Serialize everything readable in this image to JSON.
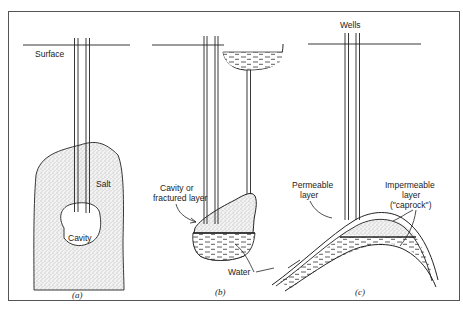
{
  "figure": {
    "panels": [
      {
        "id": "a",
        "caption": "(a)",
        "labels": {
          "surface": "Surface",
          "salt": "Salt",
          "cavity": "Cavity"
        }
      },
      {
        "id": "b",
        "caption": "(b)",
        "labels": {
          "cavity_line1": "Cavity or",
          "cavity_line2": "fractured layer",
          "water": "Water"
        }
      },
      {
        "id": "c",
        "caption": "(c)",
        "labels": {
          "wells": "Wells",
          "permeable_line1": "Permeable",
          "permeable_line2": "layer",
          "impermeable_line1": "Impermeable",
          "impermeable_line2": "layer",
          "impermeable_line3": "(\"caprock\")"
        }
      }
    ],
    "colors": {
      "ink": "#222222",
      "frame": "#555555",
      "background": "#ffffff",
      "stipple": "#b8b8b8"
    }
  }
}
